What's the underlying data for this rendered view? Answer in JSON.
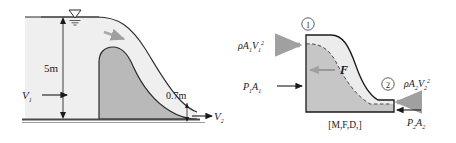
{
  "figure": {
    "colors": {
      "water_light": "#efefef",
      "structure_gray": "#bfbfbf",
      "fbd_body": "#c9c9c9",
      "fbd_water": "#ebebeb",
      "outline": "#1a1a1a",
      "arrow_gray": "#a8a8a8",
      "ground": "#5a5a5a"
    }
  },
  "left_diagram": {
    "name": "spillway-cross-section",
    "labels": {
      "upstream_velocity": "V",
      "upstream_velocity_sub": "1",
      "downstream_velocity": "V",
      "downstream_velocity_sub": "2",
      "upstream_depth": "5m",
      "downstream_depth": "0.7m"
    },
    "icons": {
      "water_surface": "water-surface-triangle-icon",
      "flow_direction": "flow-arrow-icon"
    }
  },
  "right_diagram": {
    "name": "momentum-force-diagram",
    "caption": "[M,F,D,]",
    "station_1": "1",
    "station_2": "2",
    "forces": {
      "momentum_in": {
        "rho": "ρ",
        "area": "A",
        "area_sub": "1",
        "vel": "V",
        "vel_sub": "1",
        "vel_sup": "2"
      },
      "pressure_in": {
        "p": "P",
        "p_sub": "1",
        "area": "A",
        "area_sub": "1"
      },
      "reaction": {
        "symbol": "F"
      },
      "momentum_out": {
        "rho": "ρ",
        "area": "A",
        "area_sub": "2",
        "vel": "V",
        "vel_sub": "2",
        "vel_sup": "2"
      },
      "pressure_out": {
        "p": "P",
        "p_sub": "2",
        "area": "A",
        "area_sub": "2"
      }
    }
  }
}
